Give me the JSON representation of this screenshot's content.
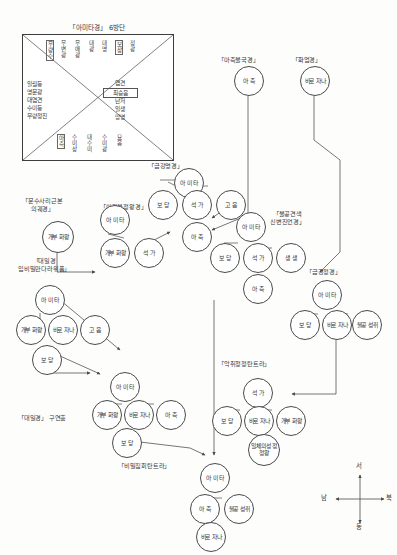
{
  "page": {
    "title": "「아미타경」 6방단",
    "footer": ""
  },
  "mandala": {
    "title": "「아미타경」 6방단",
    "top_row": [
      {
        "text": "무량수",
        "boxed": true
      },
      {
        "text": "무변광",
        "boxed": false
      },
      {
        "text": "무애광",
        "boxed": false
      },
      {
        "text": "대광",
        "boxed": false
      },
      {
        "text": "대명",
        "boxed": false
      },
      {
        "text": "보상",
        "boxed": true
      },
      {
        "text": "정광",
        "boxed": false
      }
    ],
    "left_column": [
      "일월등",
      "명문광",
      "대염견",
      "수미등",
      "무량정진"
    ],
    "right_column_title": "염견",
    "right_column_boxed": "최승음",
    "right_column": [
      "난저",
      "일생",
      "망명"
    ],
    "bottom_row": [
      {
        "text": "아촉",
        "boxed": true
      },
      {
        "text": "수미상",
        "boxed": false
      },
      {
        "text": "대수미",
        "boxed": false
      },
      {
        "text": "수미광",
        "boxed": false
      },
      {
        "text": "묘음",
        "boxed": false
      }
    ]
  },
  "sutra_labels": [
    {
      "id": "geumgang-myeonggyeong",
      "text": "「금강명경」",
      "x": 148,
      "y": 162
    },
    {
      "id": "achokbulgukgyeong",
      "text": "「아촉불국경」",
      "x": 218,
      "y": 56
    },
    {
      "id": "hwaeomgyeong",
      "text": "「화엄경」",
      "x": 292,
      "y": 56
    },
    {
      "id": "munsusari-geunbon",
      "text": "「문수사리근본\n의궤경」",
      "x": 22,
      "y": 197
    },
    {
      "id": "ijabul-jeongwanggyeong",
      "text": "「이자불정왕경」",
      "x": 100,
      "y": 203
    },
    {
      "id": "bulgonggyeonsaek",
      "text": "「불공견색\n신변진언경」",
      "x": 270,
      "y": 210
    },
    {
      "id": "geumgang-jeonggyeong",
      "text": "「금강정경」",
      "x": 306,
      "y": 268
    },
    {
      "id": "daeilgyeong-ipbimil",
      "text": "「대일경\n입비밀만다라위품」",
      "x": 18,
      "y": 257
    },
    {
      "id": "akchwi-cheongjeong",
      "text": "「악취청정탄트라」",
      "x": 218,
      "y": 360
    },
    {
      "id": "daeilgyeong-guyeonhum",
      "text": "「대일경」 구연훔",
      "x": 18,
      "y": 414
    },
    {
      "id": "bimil-jiphoe",
      "text": "「비밀집회탄트라」",
      "x": 118,
      "y": 462
    }
  ],
  "nodes": [
    {
      "id": "n-amita-top",
      "label": "아\n미\n타",
      "x": 174,
      "y": 168,
      "size": 28
    },
    {
      "id": "n-bodang-1",
      "label": "보\n당",
      "x": 148,
      "y": 190,
      "size": 28
    },
    {
      "id": "n-seokga-1",
      "label": "석\n가",
      "x": 182,
      "y": 190,
      "size": 28
    },
    {
      "id": "n-goeum",
      "label": "고\n음",
      "x": 216,
      "y": 190,
      "size": 28
    },
    {
      "id": "n-achok-1",
      "label": "아\n촉",
      "x": 182,
      "y": 222,
      "size": 28
    },
    {
      "id": "n-achok-top",
      "label": "아\n촉",
      "x": 234,
      "y": 66,
      "size": 28
    },
    {
      "id": "n-birochana-top",
      "label": "비로\n자나",
      "x": 300,
      "y": 66,
      "size": 28
    },
    {
      "id": "n-gaebu-hwawang-1",
      "label": "개부\n화왕",
      "x": 42,
      "y": 221,
      "size": 30
    },
    {
      "id": "n-gaebu-hwawang-2",
      "label": "개부\n화왕",
      "x": 100,
      "y": 238,
      "size": 28
    },
    {
      "id": "n-seokga-2",
      "label": "석\n가",
      "x": 134,
      "y": 238,
      "size": 28
    },
    {
      "id": "n-amita-2",
      "label": "아\n미\n타",
      "x": 100,
      "y": 205,
      "size": 28
    },
    {
      "id": "n-amita-3",
      "label": "아\n미\n타",
      "x": 236,
      "y": 212,
      "size": 28
    },
    {
      "id": "n-bodang-2",
      "label": "보\n당",
      "x": 210,
      "y": 243,
      "size": 28
    },
    {
      "id": "n-seokga-3",
      "label": "석\n가",
      "x": 243,
      "y": 243,
      "size": 28
    },
    {
      "id": "n-saengsaeng",
      "label": "생\n생",
      "x": 276,
      "y": 243,
      "size": 28
    },
    {
      "id": "n-achok-2",
      "label": "아\n촉",
      "x": 243,
      "y": 274,
      "size": 28
    },
    {
      "id": "n-amita-4",
      "label": "아\n미\n타",
      "x": 312,
      "y": 280,
      "size": 28
    },
    {
      "id": "n-bodang-3",
      "label": "보\n당",
      "x": 290,
      "y": 310,
      "size": 28
    },
    {
      "id": "n-birochana-2",
      "label": "비로\n자나",
      "x": 322,
      "y": 310,
      "size": 28
    },
    {
      "id": "n-bulgong-1",
      "label": "불공\n성취",
      "x": 352,
      "y": 310,
      "size": 28
    },
    {
      "id": "n-amita-5",
      "label": "아\n미\n타",
      "x": 35,
      "y": 285,
      "size": 28
    },
    {
      "id": "n-gaebu-hwawang-3",
      "label": "개부\n화왕",
      "x": 16,
      "y": 315,
      "size": 28
    },
    {
      "id": "n-birochana-3",
      "label": "비로\n자나",
      "x": 48,
      "y": 315,
      "size": 28
    },
    {
      "id": "n-goeum-2",
      "label": "고\n음",
      "x": 80,
      "y": 315,
      "size": 28
    },
    {
      "id": "n-bodang-4",
      "label": "보\n당",
      "x": 32,
      "y": 345,
      "size": 28
    },
    {
      "id": "n-amita-6",
      "label": "아\n미\n타",
      "x": 110,
      "y": 372,
      "size": 28
    },
    {
      "id": "n-gaebu-hwawang-4",
      "label": "개부\n화왕",
      "x": 92,
      "y": 400,
      "size": 28
    },
    {
      "id": "n-birochana-4",
      "label": "비로\n자나",
      "x": 124,
      "y": 400,
      "size": 28
    },
    {
      "id": "n-achok-3",
      "label": "아\n촉",
      "x": 156,
      "y": 400,
      "size": 28
    },
    {
      "id": "n-bodang-5",
      "label": "보\n당",
      "x": 112,
      "y": 428,
      "size": 28
    },
    {
      "id": "n-seokga-4",
      "label": "석\n가",
      "x": 243,
      "y": 378,
      "size": 28
    },
    {
      "id": "n-bodang-6",
      "label": "보\n당",
      "x": 212,
      "y": 406,
      "size": 28
    },
    {
      "id": "n-birochana-5",
      "label": "비로\n자나",
      "x": 244,
      "y": 406,
      "size": 28
    },
    {
      "id": "n-gaebu-hwawang-5",
      "label": "개부\n화왕",
      "x": 276,
      "y": 406,
      "size": 28
    },
    {
      "id": "n-ilche",
      "label": "일체의성\n정정왕",
      "x": 248,
      "y": 434,
      "size": 30
    },
    {
      "id": "n-amita-7",
      "label": "아\n미\n타",
      "x": 200,
      "y": 463,
      "size": 28
    },
    {
      "id": "n-achok-4",
      "label": "아\n촉",
      "x": 190,
      "y": 494,
      "size": 28
    },
    {
      "id": "n-bulgong-2",
      "label": "불공\n성취",
      "x": 224,
      "y": 494,
      "size": 28
    },
    {
      "id": "n-birochana-6",
      "label": "비로\n자나",
      "x": 196,
      "y": 522,
      "size": 28
    }
  ],
  "compass": {
    "north": "서",
    "east": "북",
    "south": "동",
    "west": "남"
  }
}
